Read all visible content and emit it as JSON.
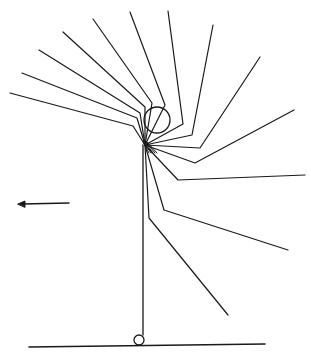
{
  "diagram": {
    "type": "stroboscopic-motion-trace",
    "stroke_color": "#1a1a1a",
    "background": "#ffffff",
    "hub": [
      145,
      145
    ],
    "direction_arrow": {
      "from": [
        69,
        203
      ],
      "to": [
        18,
        204
      ],
      "direction": "left"
    },
    "ground_line": {
      "from": [
        29,
        347
      ],
      "to": [
        265,
        344
      ]
    },
    "pivot_circle": {
      "center": [
        139,
        340
      ],
      "r": 5
    },
    "vertical_line": {
      "from": [
        143,
        145
      ],
      "to": [
        143,
        335
      ]
    },
    "head": {
      "center": [
        157,
        120
      ],
      "r": 13
    },
    "traces": [
      {
        "end": [
          10,
          93
        ],
        "knee": [
          133,
          126
        ]
      },
      {
        "end": [
          22,
          73
        ],
        "knee": [
          137,
          118
        ]
      },
      {
        "end": [
          39,
          50
        ],
        "knee": [
          140,
          113
        ]
      },
      {
        "end": [
          63,
          32
        ],
        "knee": [
          145,
          107
        ]
      },
      {
        "end": [
          93,
          19
        ],
        "knee": [
          152,
          103
        ]
      },
      {
        "end": [
          130,
          12
        ],
        "knee": [
          165,
          105
        ]
      },
      {
        "end": [
          168,
          11
        ],
        "knee": [
          183,
          124
        ]
      },
      {
        "end": [
          213,
          25
        ],
        "knee": [
          192,
          135
        ]
      },
      {
        "end": [
          260,
          57
        ],
        "knee": [
          200,
          148
        ]
      },
      {
        "end": [
          294,
          110
        ],
        "knee": [
          195,
          163
        ]
      },
      {
        "end": [
          305,
          175
        ],
        "knee": [
          178,
          180
        ]
      },
      {
        "end": [
          288,
          250
        ],
        "knee": [
          164,
          210
        ]
      },
      {
        "end": [
          228,
          315
        ],
        "knee": [
          149,
          218
        ]
      }
    ]
  }
}
